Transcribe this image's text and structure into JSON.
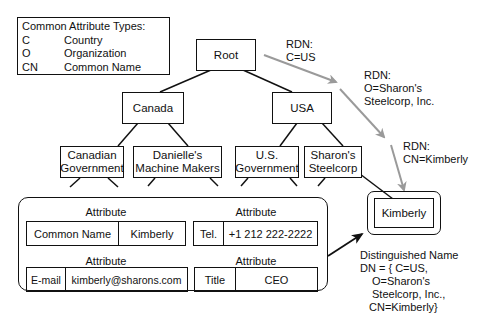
{
  "legend": {
    "title": "Common Attribute Types:",
    "items": [
      {
        "abbr": "C",
        "meaning": "Country"
      },
      {
        "abbr": "O",
        "meaning": "Organization"
      },
      {
        "abbr": "CN",
        "meaning": "Common Name"
      }
    ]
  },
  "tree": {
    "root": "Root",
    "level1": [
      "Canada",
      "USA"
    ],
    "level2": [
      {
        "line1": "Canadian",
        "line2": "Government"
      },
      {
        "line1": "Danielle's",
        "line2": "Machine Makers"
      },
      {
        "line1": "U.S.",
        "line2": "Government"
      },
      {
        "line1": "Sharon's",
        "line2": "Steelcorp"
      }
    ],
    "leaf": "Kimberly"
  },
  "rdn_labels": [
    {
      "line1": "RDN:",
      "line2": "C=US"
    },
    {
      "line1": "RDN:",
      "line2": "O=Sharon's",
      "line3": "Steelcorp, Inc."
    },
    {
      "line1": "RDN:",
      "line2": "CN=Kimberly"
    }
  ],
  "attributes": {
    "heading": "Attribute",
    "items": [
      {
        "type": "Common Name",
        "value": "Kimberly"
      },
      {
        "type": "Tel.",
        "value": "+1 212 222-2222"
      },
      {
        "type": "E-mail",
        "value": "kimberly@sharons.com"
      },
      {
        "type": "Title",
        "value": "CEO"
      }
    ]
  },
  "distinguished_name": {
    "title": "Distinguished Name",
    "lines": [
      "DN = { C=US,",
      "O=Sharon's",
      "Steelcorp, Inc.,",
      "CN=Kimberly}"
    ]
  },
  "colors": {
    "line": "#111111",
    "rdn_arrow": "#9a9a9a"
  }
}
